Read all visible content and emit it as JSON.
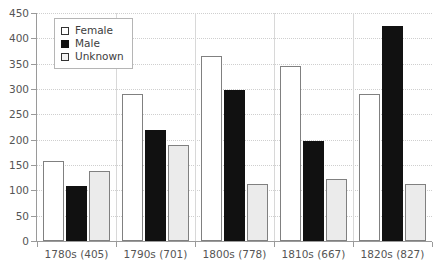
{
  "chart_data": {
    "type": "bar",
    "title": "",
    "xlabel": "",
    "ylabel": "",
    "ylim": [
      0,
      450
    ],
    "yticks": [
      0,
      50,
      100,
      150,
      200,
      250,
      300,
      350,
      400,
      450
    ],
    "ytick_labels": [
      "0",
      "50",
      "100",
      "150",
      "200",
      "250",
      "300",
      "350",
      "400",
      "450"
    ],
    "grid": true,
    "legend_position": "upper left",
    "categories": [
      "1780s (405)",
      "1790s (701)",
      "1800s (778)",
      "1810s (667)",
      "1820s (827)"
    ],
    "series": [
      {
        "name": "Female",
        "values": [
          157,
          291,
          365,
          346,
          290
        ],
        "color": "#ffffff"
      },
      {
        "name": "Male",
        "values": [
          108,
          220,
          298,
          197,
          425
        ],
        "color": "#111111"
      },
      {
        "name": "Unknown",
        "values": [
          138,
          189,
          113,
          123,
          112
        ],
        "color": "#ebebeb"
      }
    ]
  },
  "legend": {
    "items": [
      {
        "label": "Female",
        "swatch": "legend-swatch-female"
      },
      {
        "label": "Male",
        "swatch": "legend-swatch-male"
      },
      {
        "label": "Unknown",
        "swatch": "legend-swatch-unknown"
      }
    ]
  },
  "colors": {
    "female_fill": "#ffffff",
    "male_fill": "#111111",
    "unknown_fill": "#ebebeb",
    "bar_outline": "#808080",
    "gridline": "#cfcfcf",
    "axis": "#9a9a9a",
    "tick_text": "#555555"
  }
}
